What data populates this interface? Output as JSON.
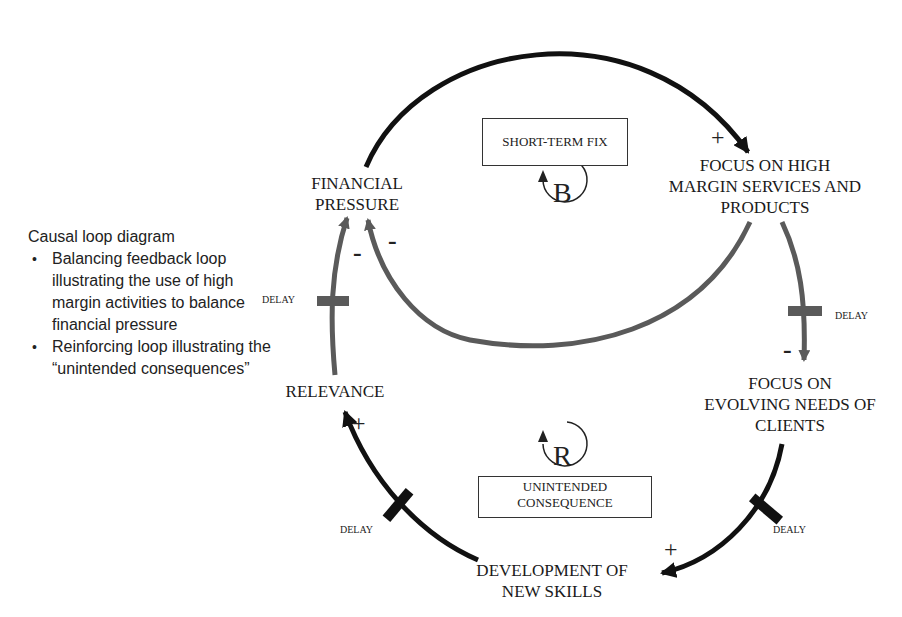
{
  "caption": {
    "title": "Causal loop diagram",
    "bullets": [
      "Balancing feedback loop illustrating the use of high margin activities to balance financial pressure",
      "Reinforcing loop illustrating the “unintended consequences”"
    ]
  },
  "nodes": {
    "financial_pressure": [
      "FINANCIAL",
      "PRESSURE"
    ],
    "focus_high_margin": [
      "FOCUS ON HIGH",
      "MARGIN SERVICES AND",
      "PRODUCTS"
    ],
    "focus_evolving": [
      "FOCUS ON",
      "EVOLVING NEEDS OF",
      "CLIENTS"
    ],
    "development": [
      "DEVELOPMENT OF",
      "NEW SKILLS"
    ],
    "relevance": "RELEVANCE"
  },
  "loops": {
    "balancing": {
      "symbol": "B",
      "label": "SHORT-TERM FIX"
    },
    "reinforcing": {
      "symbol": "R",
      "label_lines": [
        "UNINTENDED",
        "CONSEQUENCE"
      ]
    }
  },
  "delays": {
    "left": "DELAY",
    "right_top": "DELAY",
    "right_bottom": "DEALY",
    "bottom_left": "DELAY"
  },
  "signs": {
    "fp_to_high_margin": "+",
    "high_margin_to_fp": "-",
    "relevance_to_fp": "-",
    "high_margin_to_evolving": "-",
    "evolving_to_development": "+",
    "development_to_relevance": "+"
  },
  "colors": {
    "black_link": "#111111",
    "grey_link": "#5a5a5a"
  }
}
